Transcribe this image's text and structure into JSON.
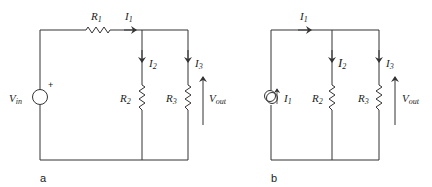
{
  "figure": {
    "panels": [
      {
        "caption": "a",
        "source": {
          "type": "voltage-source",
          "label": "V",
          "sub": "in",
          "polarity": "+"
        },
        "components": [
          {
            "label": "R",
            "sub": "1"
          },
          {
            "label": "R",
            "sub": "2"
          },
          {
            "label": "R",
            "sub": "3"
          }
        ],
        "currents": [
          {
            "label": "I",
            "sub": "1"
          },
          {
            "label": "I",
            "sub": "2"
          },
          {
            "label": "I",
            "sub": "3"
          }
        ],
        "output": {
          "label": "V",
          "sub": "out"
        }
      },
      {
        "caption": "b",
        "source": {
          "type": "current-source",
          "label": "I",
          "sub": "1"
        },
        "components": [
          {
            "label": "R",
            "sub": "2"
          },
          {
            "label": "R",
            "sub": "3"
          }
        ],
        "currents": [
          {
            "label": "I",
            "sub": "1"
          },
          {
            "label": "I",
            "sub": "2"
          },
          {
            "label": "I",
            "sub": "3"
          }
        ],
        "output": {
          "label": "V",
          "sub": "out"
        }
      }
    ]
  }
}
